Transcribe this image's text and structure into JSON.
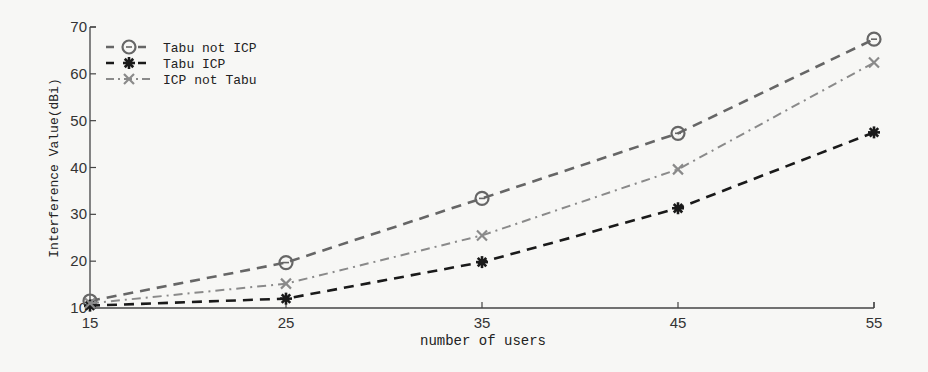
{
  "chart_data": {
    "type": "line",
    "title": "",
    "xlabel": "number of users",
    "ylabel": "Interference Value(dBi)",
    "x": [
      15,
      25,
      35,
      45,
      55
    ],
    "xlim": [
      15,
      55
    ],
    "ylim": [
      10,
      70
    ],
    "xticks": [
      15,
      25,
      35,
      45,
      55
    ],
    "yticks": [
      10,
      20,
      30,
      40,
      50,
      60,
      70
    ],
    "grid": false,
    "legend_position": "upper left",
    "series": [
      {
        "name": "Tabu not ICP",
        "values": [
          11.5,
          19.7,
          33.4,
          47.3,
          67.4
        ],
        "marker": "circle",
        "line": "dashed",
        "color": "#666666"
      },
      {
        "name": "Tabu ICP",
        "values": [
          10.5,
          12.0,
          19.8,
          31.3,
          47.5
        ],
        "marker": "star",
        "line": "dashed",
        "color": "#1a1a1a"
      },
      {
        "name": "ICP not Tabu",
        "values": [
          11.0,
          15.2,
          25.5,
          39.6,
          62.4
        ],
        "marker": "x",
        "line": "dashdot",
        "color": "#8a8a8a"
      }
    ]
  }
}
